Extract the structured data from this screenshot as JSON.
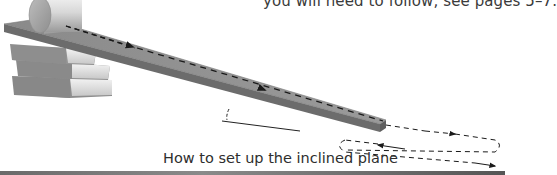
{
  "page": {
    "top_text": "you will need to follow, see pages 5–7.",
    "caption": "How to set up the inclined plane"
  },
  "illustration": {
    "elements": [
      "cylinder-roller",
      "inclined-plane-board",
      "book-stack",
      "angle-marker",
      "dashed-path-arrows"
    ],
    "book_count": 3,
    "colors": {
      "board_top": "#8c8c8c",
      "board_side": "#6e6e6e",
      "book_cover": "#8a8a8a",
      "book_pages": "#e4e4e4",
      "cylinder": "#c9c9c9",
      "dash": "#1e1e1e",
      "bottom_bar": "#6a6a6a"
    }
  }
}
